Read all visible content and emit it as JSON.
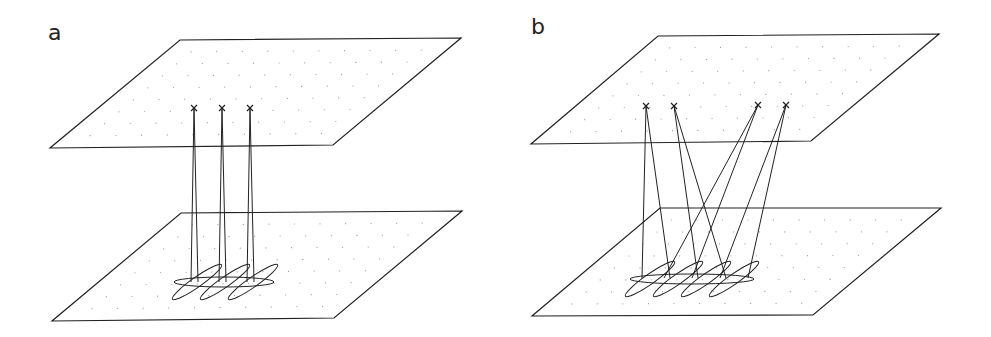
{
  "figure": {
    "panels": [
      {
        "label": "a",
        "label_pos": [
          48,
          24
        ],
        "top_plane": [
          [
            180,
            40
          ],
          [
            461,
            38
          ],
          [
            333,
            145
          ],
          [
            50,
            148
          ]
        ],
        "bottom_plane": [
          [
            181,
            213
          ],
          [
            462,
            211
          ],
          [
            334,
            318
          ],
          [
            52,
            321
          ]
        ],
        "sources": [
          [
            194,
            108
          ],
          [
            222,
            108
          ],
          [
            250,
            108
          ]
        ],
        "beams": [
          {
            "from": 0,
            "to": [
              [
                191,
                282
              ],
              [
                198,
                282
              ]
            ]
          },
          {
            "from": 1,
            "to": [
              [
                219,
                282
              ],
              [
                226,
                282
              ]
            ]
          },
          {
            "from": 2,
            "to": [
              [
                247,
                282
              ],
              [
                254,
                282
              ]
            ]
          }
        ],
        "big_ellipse": {
          "cx": 224,
          "cy": 282,
          "rx": 50,
          "ry": 5
        },
        "small_ellipses": [
          {
            "cx": 197,
            "cy": 282,
            "rx": 30,
            "ry": 5,
            "rot": -35
          },
          {
            "cx": 225,
            "cy": 282,
            "rx": 30,
            "ry": 5,
            "rot": -35
          },
          {
            "cx": 253,
            "cy": 282,
            "rx": 30,
            "ry": 5,
            "rot": -35
          }
        ]
      },
      {
        "label": "b",
        "label_pos": [
          531,
          18
        ],
        "top_plane": [
          [
            658,
            36
          ],
          [
            939,
            34
          ],
          [
            811,
            141
          ],
          [
            531,
            144
          ]
        ],
        "bottom_plane": [
          [
            660,
            208
          ],
          [
            941,
            208
          ],
          [
            813,
            315
          ],
          [
            532,
            316
          ]
        ],
        "sources": [
          [
            646,
            106
          ],
          [
            674,
            106
          ],
          [
            758,
            105
          ],
          [
            786,
            105
          ]
        ],
        "beams": [
          {
            "from": 0,
            "to": [
              [
                642,
                278
              ],
              [
                670,
                278
              ]
            ]
          },
          {
            "from": 1,
            "to": [
              [
                698,
                278
              ],
              [
                726,
                278
              ]
            ]
          },
          {
            "from": 2,
            "to": [
              [
                664,
                278
              ],
              [
                692,
                278
              ]
            ]
          },
          {
            "from": 3,
            "to": [
              [
                720,
                278
              ],
              [
                748,
                278
              ]
            ]
          }
        ],
        "big_ellipse": {
          "cx": 692,
          "cy": 279,
          "rx": 62,
          "ry": 5
        },
        "small_ellipses": [
          {
            "cx": 650,
            "cy": 279,
            "rx": 30,
            "ry": 5,
            "rot": -35
          },
          {
            "cx": 678,
            "cy": 279,
            "rx": 30,
            "ry": 5,
            "rot": -35
          },
          {
            "cx": 706,
            "cy": 279,
            "rx": 30,
            "ry": 5,
            "rot": -35
          },
          {
            "cx": 734,
            "cy": 279,
            "rx": 30,
            "ry": 5,
            "rot": -35
          }
        ]
      }
    ],
    "grid": {
      "rows": 8,
      "cols": 10,
      "dot_color": "#999999"
    },
    "colors": {
      "line": "#222222",
      "background": "#ffffff"
    }
  }
}
